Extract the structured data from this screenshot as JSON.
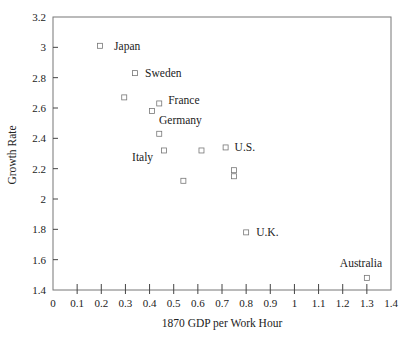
{
  "chart_data": {
    "type": "scatter",
    "title": "",
    "xlabel": "1870 GDP per Work Hour",
    "ylabel": "Growth Rate",
    "xlim": [
      0,
      1.4
    ],
    "ylim": [
      1.4,
      3.2
    ],
    "x_ticks": [
      "0",
      "0.1",
      "0.2",
      "0.3",
      "0.4",
      "0.5",
      "0.6",
      "0.7",
      "0.8",
      "0.9",
      "1",
      "1.1",
      "1.2",
      "1.3",
      "1.4"
    ],
    "y_ticks": [
      "1.4",
      "1.6",
      "1.8",
      "2",
      "2.2",
      "2.4",
      "2.6",
      "2.8",
      "3",
      "3.2"
    ],
    "grid": false,
    "legend": null,
    "marker": "open-square",
    "points": [
      {
        "label": "Japan",
        "x": 0.195,
        "y": 3.01,
        "label_dx": 14,
        "label_dy": 4
      },
      {
        "label": "Sweden",
        "x": 0.34,
        "y": 2.83,
        "label_dx": 10,
        "label_dy": 4
      },
      {
        "label": "",
        "x": 0.295,
        "y": 2.67
      },
      {
        "label": "France",
        "x": 0.44,
        "y": 2.63,
        "label_dx": 9,
        "label_dy": 1
      },
      {
        "label": "Germany",
        "x": 0.41,
        "y": 2.58,
        "label_dx": 7,
        "label_dy": 13
      },
      {
        "label": "",
        "x": 0.44,
        "y": 2.43
      },
      {
        "label": "Italy",
        "x": 0.46,
        "y": 2.32,
        "label_dx": -32,
        "label_dy": 11
      },
      {
        "label": "",
        "x": 0.615,
        "y": 2.32
      },
      {
        "label": "U.S.",
        "x": 0.715,
        "y": 2.34,
        "label_dx": 9,
        "label_dy": 4
      },
      {
        "label": "",
        "x": 0.75,
        "y": 2.19
      },
      {
        "label": "",
        "x": 0.75,
        "y": 2.15
      },
      {
        "label": "",
        "x": 0.54,
        "y": 2.12
      },
      {
        "label": "U.K.",
        "x": 0.8,
        "y": 1.78,
        "label_dx": 10,
        "label_dy": 4
      },
      {
        "label": "Australia",
        "x": 1.3,
        "y": 1.48,
        "label_dx": -27,
        "label_dy": -11
      }
    ]
  },
  "colors": {
    "frame": "#777777",
    "marker": "#777777",
    "text": "#222222",
    "background": "#ffffff"
  }
}
